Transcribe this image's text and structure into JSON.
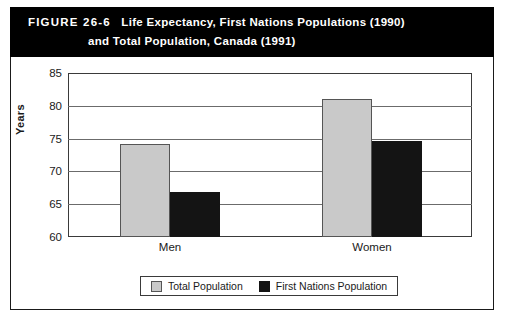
{
  "figure": {
    "label": "FIGURE 26-6",
    "title_line_1": "Life Expectancy, First Nations Populations (1990)",
    "title_line_2": "and Total Population, Canada (1991)"
  },
  "colors": {
    "band_background": "#000000",
    "band_text": "#ffffff",
    "total_population": "#c9c9c9",
    "first_nations_population": "#141414",
    "gridline": "#6b6b6b",
    "frame": "#1a1a1a"
  },
  "legend": {
    "items": [
      {
        "label": "Total Population",
        "swatch": "total"
      },
      {
        "label": "First Nations Population",
        "swatch": "firstnations"
      }
    ]
  },
  "chart_data": {
    "type": "bar",
    "title": "Life Expectancy, First Nations Populations (1990) and Total Population, Canada (1991)",
    "xlabel": "",
    "ylabel": "Years",
    "categories": [
      "Men",
      "Women"
    ],
    "series": [
      {
        "name": "Total Population",
        "values": [
          74.2,
          81.0
        ]
      },
      {
        "name": "First Nations Population",
        "values": [
          66.9,
          74.7
        ]
      }
    ],
    "ylim": [
      60,
      85
    ],
    "yticks": [
      60,
      65,
      70,
      75,
      80,
      85
    ],
    "ytick_labels": [
      "60",
      "65",
      "70",
      "75",
      "80",
      "85"
    ],
    "grid": true,
    "legend_position": "bottom"
  }
}
